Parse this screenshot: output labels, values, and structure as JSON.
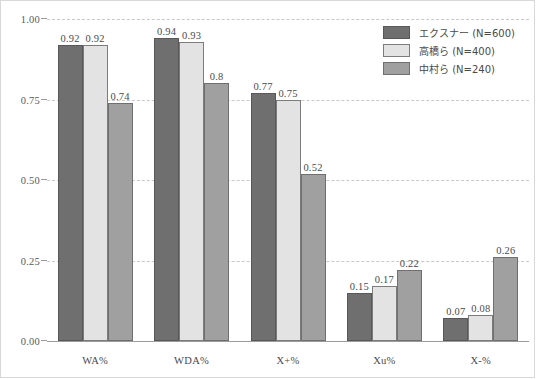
{
  "chart_data": {
    "type": "bar",
    "title": "",
    "subtitle": "",
    "xlabel": "",
    "ylabel": "",
    "categories": [
      "WA%",
      "WDA%",
      "X+%",
      "Xu%",
      "X-%"
    ],
    "series": [
      {
        "name": "エクスナー (N=600)",
        "color": "#6f6f6f",
        "values": [
          0.92,
          0.94,
          0.77,
          0.15,
          0.07
        ],
        "labels": [
          "0.92",
          "0.94",
          "0.77",
          "0.15",
          "0.07"
        ]
      },
      {
        "name": "高橋ら (N=400)",
        "color": "#e3e3e3",
        "values": [
          0.92,
          0.93,
          0.75,
          0.17,
          0.08
        ],
        "labels": [
          "0.92",
          "0.93",
          "0.75",
          "0.17",
          "0.08"
        ]
      },
      {
        "name": "中村ら (N=240)",
        "color": "#a0a0a0",
        "values": [
          0.74,
          0.8,
          0.52,
          0.22,
          0.26
        ],
        "labels": [
          "0.74",
          "0.8",
          "0.52",
          "0.22",
          "0.26"
        ]
      }
    ],
    "ylim": [
      0.0,
      1.0
    ],
    "yticks": [
      0.0,
      0.25,
      0.5,
      0.75,
      1.0
    ],
    "ytick_labels": [
      "0.00",
      "0.25",
      "0.50",
      "0.75",
      "1.00"
    ],
    "grid": true,
    "grid_axis": "y",
    "grid_style": "dashed",
    "grid_color": "#c9c9c9",
    "legend_position": "top-right",
    "background": "#ffffff",
    "frame_color": "#d8d8d8",
    "axis_color": "#9b9b9b",
    "text_color": "#4a4a4a"
  },
  "legend": {
    "items": [
      {
        "label": "エクスナー (N=600)"
      },
      {
        "label": "高橋ら (N=400)"
      },
      {
        "label": "中村ら (N=240)"
      }
    ]
  },
  "yaxis": {
    "labels": [
      "1.00",
      "0.75",
      "0.50",
      "0.25",
      "0.00"
    ]
  },
  "xaxis": {
    "labels": [
      "WA%",
      "WDA%",
      "X+%",
      "Xu%",
      "X-%"
    ]
  }
}
